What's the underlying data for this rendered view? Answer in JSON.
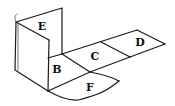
{
  "diagram": {
    "type": "folded-cube-net",
    "faces": [
      {
        "id": "E",
        "label": "E",
        "x": 42,
        "y": 27
      },
      {
        "id": "B",
        "label": "B",
        "x": 57,
        "y": 70
      },
      {
        "id": "C",
        "label": "C",
        "x": 95,
        "y": 57
      },
      {
        "id": "D",
        "label": "D",
        "x": 140,
        "y": 43
      },
      {
        "id": "F",
        "label": "F",
        "x": 90,
        "y": 88
      }
    ],
    "colors": {
      "stroke": "#1a1a1a",
      "background": "#ffffff"
    }
  }
}
